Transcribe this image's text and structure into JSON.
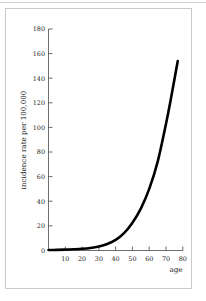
{
  "figure": {
    "frame_color": "#c9c9c9",
    "background": "#ffffff"
  },
  "chart_data": {
    "type": "line",
    "title": "",
    "subtitle": "",
    "xlabel": "age",
    "ylabel": "incidence rate per 100,000",
    "xlim": [
      0,
      80
    ],
    "ylim": [
      0,
      180
    ],
    "xticks": [
      10,
      20,
      30,
      40,
      50,
      60,
      70,
      80
    ],
    "xtick_labels": [
      "10",
      "20",
      "30",
      "40",
      "50",
      "60",
      "70",
      "80"
    ],
    "yticks": [
      0,
      20,
      40,
      60,
      80,
      100,
      120,
      140,
      160,
      180
    ],
    "ytick_labels": [
      "0",
      "20",
      "40",
      "60",
      "80",
      "100",
      "120",
      "140",
      "160",
      "180"
    ],
    "grid": false,
    "legend": null,
    "legend_position": "none",
    "series": [
      {
        "name": "incidence rate",
        "color": "#000000",
        "line_width": 2.6,
        "x": [
          0,
          5,
          10,
          15,
          20,
          25,
          30,
          35,
          40,
          45,
          50,
          55,
          60,
          65,
          70,
          73,
          75,
          77
        ],
        "values": [
          0.3,
          0.4,
          0.6,
          0.9,
          1.3,
          2.0,
          3.2,
          5.2,
          8.5,
          14.0,
          22.5,
          34.0,
          50.0,
          72.0,
          103.0,
          124.0,
          139.0,
          154.0
        ]
      }
    ],
    "annotations": []
  },
  "axis": {
    "x_title": "age",
    "y_title": "incidence rate per 100,000"
  }
}
